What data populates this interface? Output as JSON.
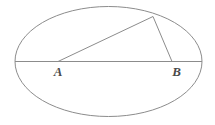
{
  "figure": {
    "background_color": "#ffffff",
    "stroke_color": "#8c8c8c",
    "label_color": "#4a4a4a",
    "ellipse": {
      "name": "ellipse-outline",
      "center_x": 108.5,
      "center_y": 61.5,
      "radius_x": 93.5,
      "radius_y": 55.0,
      "stroke_width": 1.0
    },
    "segments": [
      {
        "name": "major-axis-chord",
        "x1": 15.0,
        "y1": 61.5,
        "x2": 202.0,
        "y2": 61.5,
        "stroke_width": 1.0
      },
      {
        "name": "segment-a-to-apex",
        "x1": 58.0,
        "y1": 61.5,
        "x2": 153.0,
        "y2": 16.5,
        "stroke_width": 1.0
      },
      {
        "name": "segment-apex-to-b",
        "x1": 153.0,
        "y1": 16.5,
        "x2": 172.0,
        "y2": 61.5,
        "stroke_width": 1.0
      }
    ],
    "points": [
      {
        "name": "point-a",
        "label": "A",
        "x": 58.0,
        "y": 61.5,
        "label_x": 58.0,
        "label_y": 76.0
      },
      {
        "name": "point-b",
        "label": "B",
        "x": 172.0,
        "y": 61.5,
        "label_x": 176.5,
        "label_y": 76.0
      },
      {
        "name": "point-apex",
        "label": "",
        "x": 153.0,
        "y": 16.5,
        "label_x": 153.0,
        "label_y": 10.0
      }
    ]
  }
}
